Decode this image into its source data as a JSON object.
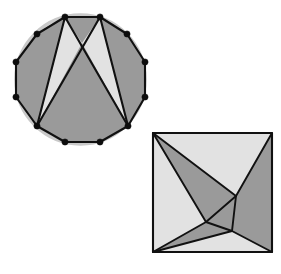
{
  "figure": {
    "background_color": "#ffffff",
    "colors": {
      "dark_fill": "#9a9a9a",
      "light_fill": "#e2e2e2",
      "shadow_fill": "#c9c9c9",
      "edge_stroke": "#111111",
      "vertex_dot": "#0d0d0d"
    },
    "shapes": [
      {
        "name": "dodecagon-partition",
        "kind": "polygon",
        "sides": 12,
        "vertex_markers": true,
        "vertex_marker_radius": 3.1,
        "outline": [
          [
            65,
            17
          ],
          [
            100,
            17
          ],
          [
            127,
            34
          ],
          [
            145,
            62
          ],
          [
            145,
            97
          ],
          [
            128,
            126
          ],
          [
            100,
            142
          ],
          [
            65,
            142
          ],
          [
            37,
            126
          ],
          [
            16,
            97
          ],
          [
            16,
            62
          ],
          [
            37,
            34
          ]
        ],
        "regions": [
          {
            "name": "left-dark-wedge",
            "shade": "dark",
            "points": [
              [
                65,
                17
              ],
              [
                37,
                34
              ],
              [
                16,
                62
              ],
              [
                16,
                97
              ],
              [
                37,
                126
              ],
              [
                41,
                105
              ]
            ]
          },
          {
            "name": "left-light-triangle",
            "shade": "light",
            "points": [
              [
                65,
                17
              ],
              [
                37,
                126
              ],
              [
                82,
                43
              ]
            ]
          },
          {
            "name": "center-dark-triangle",
            "shade": "dark",
            "points": [
              [
                65,
                17
              ],
              [
                100,
                17
              ],
              [
                82,
                43
              ]
            ]
          },
          {
            "name": "right-light-triangle",
            "shade": "light",
            "points": [
              [
                100,
                17
              ],
              [
                128,
                126
              ],
              [
                82,
                43
              ]
            ]
          },
          {
            "name": "right-dark-wedge",
            "shade": "dark",
            "points": [
              [
                100,
                17
              ],
              [
                127,
                34
              ],
              [
                145,
                62
              ],
              [
                145,
                97
              ],
              [
                128,
                126
              ]
            ]
          },
          {
            "name": "bottom-dark-region",
            "shade": "dark",
            "points": [
              [
                37,
                126
              ],
              [
                82,
                43
              ],
              [
                128,
                126
              ],
              [
                100,
                142
              ],
              [
                65,
                142
              ]
            ]
          }
        ],
        "diagonals": [
          {
            "name": "diagonal-top-left-to-bottom-right",
            "from": [
              65,
              17
            ],
            "to": [
              128,
              126
            ]
          },
          {
            "name": "diagonal-top-right-to-bottom-left",
            "from": [
              100,
              17
            ],
            "to": [
              37,
              126
            ]
          },
          {
            "name": "diagonal-top-left-to-bottom-left",
            "from": [
              65,
              17
            ],
            "to": [
              37,
              126
            ]
          },
          {
            "name": "diagonal-top-right-to-bottom-right",
            "from": [
              100,
              17
            ],
            "to": [
              128,
              126
            ]
          }
        ]
      },
      {
        "name": "square-partition",
        "kind": "quadrilateral",
        "sides": 4,
        "vertex_markers": false,
        "outline": [
          [
            153,
            133
          ],
          [
            272,
            133
          ],
          [
            272,
            252
          ],
          [
            153,
            252
          ]
        ],
        "regions": [
          {
            "name": "top-light-triangle",
            "shade": "light",
            "points": [
              [
                153,
                133
              ],
              [
                272,
                133
              ],
              [
                236,
                196
              ]
            ]
          },
          {
            "name": "left-light-triangle",
            "shade": "light",
            "points": [
              [
                153,
                133
              ],
              [
                206,
                222
              ],
              [
                153,
                252
              ]
            ]
          },
          {
            "name": "bottom-light-triangle",
            "shade": "light",
            "points": [
              [
                153,
                252
              ],
              [
                232,
                231
              ],
              [
                272,
                252
              ]
            ]
          },
          {
            "name": "right-light-sliver",
            "shade": "light",
            "points": [
              [
                272,
                133
              ],
              [
                272,
                252
              ],
              [
                236,
                196
              ]
            ]
          },
          {
            "name": "upper-dark-region",
            "shade": "dark",
            "points": [
              [
                153,
                133
              ],
              [
                236,
                196
              ],
              [
                232,
                231
              ],
              [
                206,
                222
              ]
            ]
          },
          {
            "name": "lower-left-dark-region",
            "shade": "dark",
            "points": [
              [
                153,
                133
              ],
              [
                206,
                222
              ],
              [
                153,
                252
              ]
            ]
          },
          {
            "name": "inner-triangle",
            "shade": "dark",
            "points": [
              [
                236,
                196
              ],
              [
                232,
                231
              ],
              [
                206,
                222
              ]
            ]
          }
        ],
        "cuts": [
          {
            "name": "cut-topleft-to-node-a",
            "from": [
              153,
              133
            ],
            "to": [
              236,
              196
            ]
          },
          {
            "name": "cut-topright-to-node-a",
            "from": [
              272,
              133
            ],
            "to": [
              236,
              196
            ]
          },
          {
            "name": "cut-topleft-to-node-b",
            "from": [
              153,
              133
            ],
            "to": [
              206,
              222
            ]
          },
          {
            "name": "cut-bottomleft-to-node-b",
            "from": [
              153,
              252
            ],
            "to": [
              206,
              222
            ]
          },
          {
            "name": "cut-bottomright-to-node-c",
            "from": [
              272,
              252
            ],
            "to": [
              232,
              231
            ]
          },
          {
            "name": "cut-bottomleft-to-node-c",
            "from": [
              153,
              252
            ],
            "to": [
              232,
              231
            ]
          },
          {
            "name": "inner-edge-a-b",
            "from": [
              236,
              196
            ],
            "to": [
              206,
              222
            ]
          },
          {
            "name": "inner-edge-b-c",
            "from": [
              206,
              222
            ],
            "to": [
              232,
              231
            ]
          },
          {
            "name": "inner-edge-c-a",
            "from": [
              232,
              231
            ],
            "to": [
              236,
              196
            ]
          }
        ]
      }
    ]
  }
}
